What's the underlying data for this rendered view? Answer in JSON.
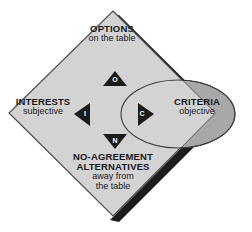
{
  "diagram": {
    "colors": {
      "diamond_fill": "#d3d3d3",
      "diamond_stroke": "#4a4a4a",
      "shadow": "#1c1c1c",
      "ellipse_inside_fill": "#d3d3d3",
      "ellipse_outside_fill": "#a8a8a8",
      "ellipse_stroke": "#3c3c3c",
      "triangle_fill": "#1c1c1c",
      "text": "#17171a",
      "letter_text": "#ffffff",
      "background": "#ffffff"
    },
    "quadrants": {
      "top": {
        "title": "OPTIONS",
        "subtitle": "on the table",
        "letter": "O"
      },
      "left": {
        "title": "INTERESTS",
        "subtitle": "subjective",
        "letter": "I"
      },
      "right": {
        "title": "CRITERIA",
        "subtitle": "objective",
        "letter": "C"
      },
      "bottom": {
        "title_line1": "NO-AGREEMENT",
        "title_line2": "ALTERNATIVES",
        "subtitle_line1": "away from",
        "subtitle_line2": "the table",
        "letter": "N"
      }
    }
  }
}
